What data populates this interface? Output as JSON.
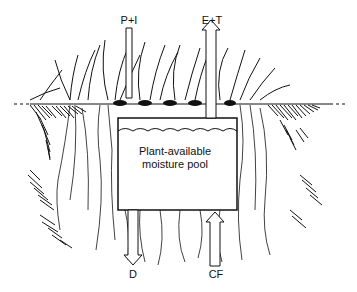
{
  "diagram": {
    "pool_label_line1": "Plant-available",
    "pool_label_line2": "moisture pool",
    "flows": [
      {
        "id": "precip_irrigation",
        "label": "P+I",
        "direction": "down"
      },
      {
        "id": "evap_transpiration",
        "label": "E+T",
        "direction": "up"
      },
      {
        "id": "drainage",
        "label": "D",
        "direction": "down"
      },
      {
        "id": "capillary_flow",
        "label": "CF",
        "direction": "up"
      }
    ],
    "colors": {
      "ink": "#111111",
      "background": "#ffffff"
    }
  }
}
